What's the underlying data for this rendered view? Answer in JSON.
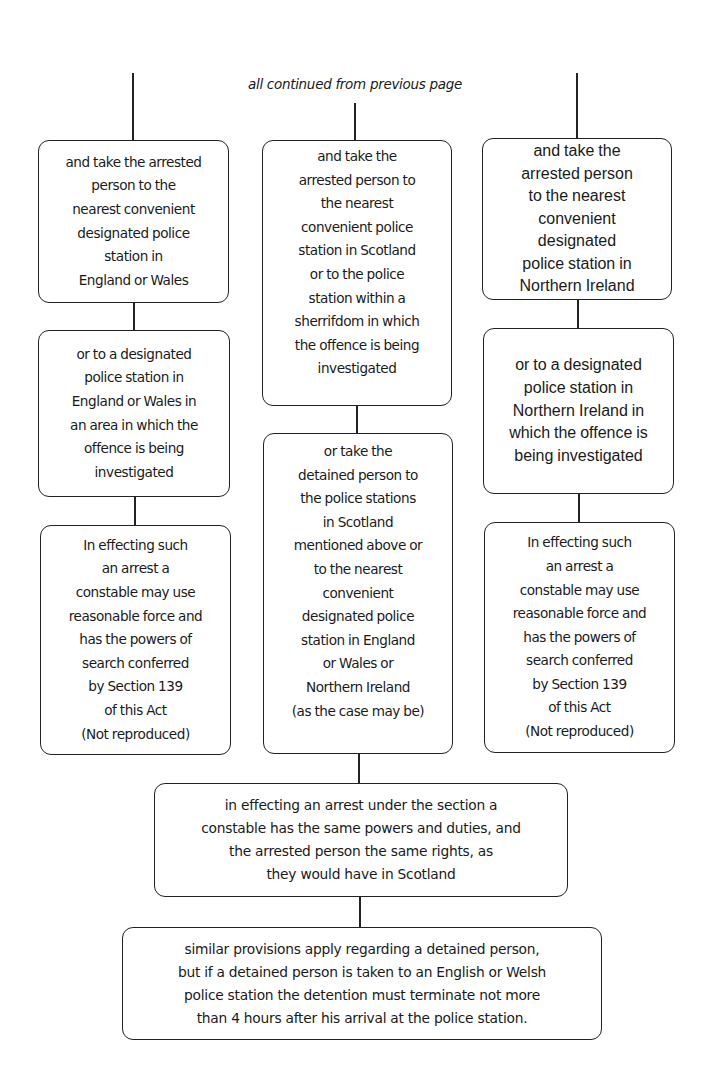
{
  "diagram": {
    "header_note": "all continued from previous page",
    "columns": [
      {
        "id": "england-wales",
        "boxes": [
          {
            "text": "and take the arrested\nperson to the\nnearest convenient\ndesignated police\nstation in\nEngland or Wales"
          },
          {
            "text": "or to a designated\npolice station in\nEngland or Wales in\nan area in which the\noffence is being\ninvestigated"
          },
          {
            "text": "In effecting such\nan arrest a\nconstable may use\nreasonable force and\nhas the powers of\nsearch conferred\nby Section 139\nof this Act\n(Not reproduced)"
          }
        ]
      },
      {
        "id": "scotland",
        "boxes": [
          {
            "text": "and take the\narrested person to\nthe nearest\nconvenient police\nstation in Scotland\nor to the police\nstation within a\nsherrifdom in which\nthe offence is being\ninvestigated"
          },
          {
            "text": "or take the\ndetained person to\nthe police stations\nin Scotland\nmentioned above or\nto the nearest\nconvenient\ndesignated police\nstation in England\nor Wales or\nNorthern Ireland\n(as the case may be)"
          }
        ]
      },
      {
        "id": "northern-ireland",
        "boxes": [
          {
            "text": "and take the\narrested person\nto the nearest\nconvenient\ndesignated\npolice station in\nNorthern Ireland"
          },
          {
            "text": "or to a designated\npolice station in\nNorthern Ireland in\nwhich the offence is\nbeing investigated"
          },
          {
            "text": "In effecting such\nan arrest a\nconstable may use\nreasonable force and\nhas the powers of\nsearch conferred\nby Section 139\nof this Act\n(Not reproduced)"
          }
        ]
      }
    ],
    "merged_boxes": [
      {
        "text": "in effecting an arrest under the section a\nconstable has the same powers and duties, and\nthe arrested person the same rights, as\nthey would have in Scotland"
      },
      {
        "text": "similar provisions apply regarding a detained person,\nbut if a detained person is taken to an English or Welsh\npolice station the detention must terminate not more\nthan 4 hours after his arrival at the police station."
      }
    ]
  }
}
